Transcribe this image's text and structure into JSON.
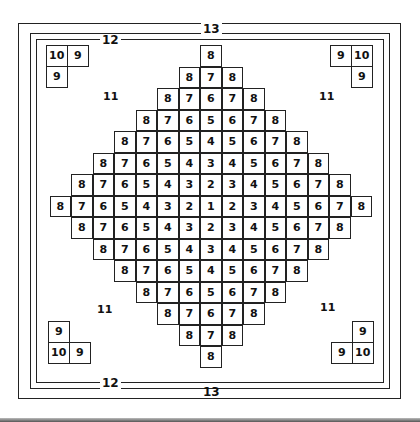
{
  "diagram": {
    "frames": [
      {
        "label": "13",
        "name": "outer-frame"
      },
      {
        "label": "12",
        "name": "inner-frame"
      }
    ],
    "grid_rows": [
      [
        8
      ],
      [
        8,
        7,
        8
      ],
      [
        8,
        7,
        6,
        7,
        8
      ],
      [
        8,
        7,
        6,
        5,
        6,
        7,
        8
      ],
      [
        8,
        7,
        6,
        5,
        4,
        5,
        6,
        7,
        8
      ],
      [
        8,
        7,
        6,
        5,
        4,
        3,
        4,
        5,
        6,
        7,
        8
      ],
      [
        8,
        7,
        6,
        5,
        4,
        3,
        2,
        3,
        4,
        5,
        6,
        7,
        8
      ],
      [
        8,
        7,
        6,
        5,
        4,
        3,
        2,
        1,
        2,
        3,
        4,
        5,
        6,
        7,
        8
      ],
      [
        8,
        7,
        6,
        5,
        4,
        3,
        2,
        3,
        4,
        5,
        6,
        7,
        8
      ],
      [
        8,
        7,
        6,
        5,
        4,
        3,
        4,
        5,
        6,
        7,
        8
      ],
      [
        8,
        7,
        6,
        5,
        4,
        5,
        6,
        7,
        8
      ],
      [
        8,
        7,
        6,
        5,
        6,
        7,
        8
      ],
      [
        8,
        7,
        6,
        7,
        8
      ],
      [
        8,
        7,
        8
      ],
      [
        8
      ]
    ],
    "corners": {
      "top_left": {
        "corner": "10",
        "side": "9",
        "below": "9"
      },
      "top_right": {
        "corner": "10",
        "side": "9",
        "below": "9"
      },
      "bottom_left": {
        "corner": "10",
        "side": "9",
        "above": "9"
      },
      "bottom_right": {
        "corner": "10",
        "side": "9",
        "above": "9"
      }
    },
    "region_labels": {
      "top_left": "11",
      "top_right": "11",
      "bottom_left": "11",
      "bottom_right": "11"
    }
  }
}
